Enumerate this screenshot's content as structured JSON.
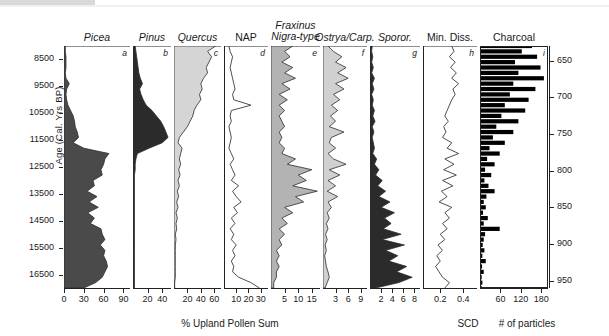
{
  "axes": {
    "left": {
      "label": "Age (Cal. Yrs BP)",
      "ticks": [
        "8500",
        "9500",
        "10500",
        "11500",
        "12500",
        "13500",
        "14500",
        "15500",
        "16500"
      ],
      "range": [
        8000,
        17000
      ]
    },
    "right": {
      "label": "Depth (cm)",
      "ticks": [
        "650",
        "700",
        "750",
        "800",
        "850",
        "900",
        "950"
      ],
      "range": [
        630,
        960
      ]
    },
    "x_units": {
      "pollen": "% Upland Pollen Sum",
      "min_diss": "SCD",
      "charcoal": "# of particles"
    }
  },
  "chart_data": {
    "type": "area",
    "title": "",
    "xlabel": "% Upland Pollen Sum",
    "ylabel": "Age (Cal. Yrs BP)",
    "grid": false,
    "legend_position": "none",
    "y_axis_secondary": {
      "label": "Depth (cm)",
      "ticks": [
        650,
        700,
        750,
        800,
        850,
        900,
        950
      ]
    },
    "y": [
      8000,
      8200,
      8400,
      8600,
      8800,
      9000,
      9200,
      9400,
      9600,
      9800,
      10000,
      10200,
      10400,
      10600,
      10800,
      11000,
      11200,
      11400,
      11600,
      11800,
      12000,
      12200,
      12400,
      12600,
      12800,
      13000,
      13200,
      13400,
      13600,
      13800,
      14000,
      14200,
      14400,
      14600,
      14800,
      15000,
      15200,
      15400,
      15600,
      15800,
      16000,
      16200,
      16400,
      16600,
      16800,
      17000
    ],
    "panels": [
      {
        "key": "picea",
        "letter": "a",
        "title": "Picea",
        "italic": true,
        "fill": "#4a4a4a",
        "style": "filled",
        "xlim": [
          0,
          100
        ],
        "xticks": [
          0,
          30,
          60,
          90
        ],
        "values": [
          2,
          2,
          3,
          3,
          3,
          2,
          3,
          8,
          4,
          3,
          4,
          6,
          10,
          14,
          16,
          17,
          20,
          22,
          14,
          30,
          68,
          62,
          60,
          56,
          58,
          44,
          46,
          35,
          50,
          38,
          52,
          36,
          46,
          40,
          56,
          58,
          62,
          55,
          62,
          60,
          64,
          66,
          62,
          58,
          48,
          30
        ]
      },
      {
        "key": "pinus",
        "letter": "b",
        "title": "Pinus",
        "italic": true,
        "fill": "#2b2b2b",
        "style": "filled",
        "xlim": [
          0,
          52
        ],
        "xticks": [
          20,
          40
        ],
        "values": [
          3,
          4,
          5,
          6,
          7,
          8,
          10,
          13,
          9,
          11,
          14,
          18,
          26,
          32,
          38,
          42,
          45,
          48,
          40,
          22,
          6,
          4,
          3,
          3,
          2,
          2,
          2,
          2,
          2,
          2,
          2,
          2,
          2,
          2,
          2,
          2,
          2,
          2,
          2,
          2,
          2,
          2,
          2,
          2,
          2,
          2
        ]
      },
      {
        "key": "quercus",
        "letter": "c",
        "title": "Quercus",
        "italic": true,
        "fill": "#d5d5d5",
        "style": "filled",
        "xlim": [
          0,
          70
        ],
        "xticks": [
          20,
          40,
          60
        ],
        "values": [
          62,
          50,
          56,
          52,
          48,
          50,
          44,
          40,
          42,
          38,
          40,
          34,
          30,
          28,
          24,
          20,
          14,
          8,
          6,
          12,
          10,
          8,
          10,
          7,
          9,
          6,
          8,
          5,
          7,
          4,
          6,
          3,
          5,
          3,
          4,
          2,
          3,
          2,
          2,
          2,
          2,
          2,
          2,
          2,
          1,
          1
        ]
      },
      {
        "key": "nap",
        "letter": "d",
        "title": "NAP",
        "italic": false,
        "fill": "none",
        "style": "line",
        "xlim": [
          0,
          36
        ],
        "xticks": [
          10,
          20,
          30
        ],
        "values": [
          4,
          5,
          7,
          6,
          5,
          6,
          7,
          8,
          9,
          7,
          8,
          22,
          6,
          5,
          6,
          4,
          5,
          6,
          5,
          4,
          6,
          8,
          5,
          7,
          9,
          6,
          12,
          7,
          10,
          14,
          8,
          11,
          6,
          9,
          5,
          8,
          6,
          10,
          7,
          9,
          6,
          8,
          7,
          12,
          22,
          29
        ]
      },
      {
        "key": "fraxinus",
        "letter": "e",
        "title": "Fraxinus Nigra-type",
        "italic": true,
        "fill": "#b3b3b3",
        "style": "filled",
        "xlim": [
          0,
          18
        ],
        "xticks": [
          5,
          10,
          15
        ],
        "values": [
          8,
          5,
          7,
          4,
          8,
          5,
          9,
          4,
          7,
          3,
          6,
          3,
          5,
          3,
          4,
          5,
          3,
          4,
          3,
          5,
          4,
          9,
          6,
          15,
          10,
          13,
          8,
          17,
          9,
          12,
          5,
          8,
          4,
          6,
          3,
          5,
          3,
          4,
          2,
          3,
          2,
          3,
          2,
          2,
          1,
          1
        ]
      },
      {
        "key": "ostrya",
        "letter": "f",
        "title": "Ostrya/Carp.",
        "italic": true,
        "fill": "#d0d0d0",
        "style": "filled",
        "xlim": [
          0,
          10.5
        ],
        "xticks": [
          3,
          6,
          9
        ],
        "values": [
          1.2,
          2.5,
          4.5,
          3.0,
          5.5,
          3.5,
          6.0,
          3.0,
          5.0,
          2.5,
          4.0,
          2.0,
          3.5,
          1.8,
          3.0,
          1.5,
          5.0,
          2.0,
          1.5,
          3.0,
          1.2,
          2.5,
          5.5,
          1.5,
          4.0,
          1.2,
          3.0,
          1.0,
          3.5,
          1.2,
          2.0,
          1.0,
          1.5,
          0.8,
          1.2,
          0.6,
          1.0,
          0.5,
          0.8,
          0.4,
          0.6,
          0.8,
          1.2,
          1.5,
          1.0,
          0.5
        ]
      },
      {
        "key": "sporor",
        "letter": "g",
        "title": "Sporor.",
        "italic": true,
        "fill": "#2b2b2b",
        "style": "filled",
        "xlim": [
          0,
          9
        ],
        "xticks": [
          2,
          4,
          6,
          8
        ],
        "values": [
          0.4,
          0.3,
          0.5,
          0.3,
          0.6,
          0.3,
          0.8,
          0.4,
          0.7,
          0.3,
          0.6,
          0.4,
          0.8,
          0.5,
          0.9,
          0.4,
          0.7,
          0.4,
          0.6,
          0.8,
          0.5,
          1.2,
          0.8,
          1.6,
          1.0,
          2.2,
          1.4,
          2.8,
          1.6,
          3.6,
          2.0,
          4.4,
          2.6,
          3.8,
          2.4,
          5.6,
          2.2,
          6.2,
          2.8,
          5.0,
          3.4,
          6.6,
          4.8,
          7.6,
          5.2,
          1.0
        ]
      },
      {
        "key": "min_diss",
        "letter": "h",
        "title": "Min. Diss.",
        "italic": false,
        "fill": "none",
        "style": "line",
        "xlim": [
          0.05,
          0.52
        ],
        "xticks": [
          0.2,
          0.4
        ],
        "values": [
          0.3,
          0.32,
          0.28,
          0.33,
          0.29,
          0.34,
          0.3,
          0.36,
          0.31,
          0.33,
          0.3,
          0.28,
          0.26,
          0.24,
          0.27,
          0.23,
          0.25,
          0.22,
          0.3,
          0.26,
          0.36,
          0.24,
          0.32,
          0.23,
          0.34,
          0.22,
          0.31,
          0.21,
          0.26,
          0.19,
          0.3,
          0.24,
          0.28,
          0.22,
          0.26,
          0.2,
          0.24,
          0.18,
          0.22,
          0.17,
          0.2,
          0.16,
          0.19,
          0.22,
          0.28,
          0.24
        ]
      },
      {
        "key": "charcoal",
        "letter": "i",
        "title": "Charcoal",
        "italic": false,
        "fill": "#000000",
        "style": "bars",
        "xlim": [
          0,
          200
        ],
        "xticks": [
          60,
          120,
          180
        ],
        "values": [
          150,
          120,
          165,
          100,
          175,
          110,
          185,
          95,
          160,
          85,
          140,
          70,
          130,
          60,
          110,
          45,
          95,
          35,
          70,
          25,
          55,
          18,
          40,
          12,
          30,
          10,
          22,
          40,
          16,
          8,
          14,
          6,
          20,
          8,
          55,
          12,
          8,
          5,
          10,
          4,
          14,
          3,
          8,
          2,
          4,
          2
        ]
      }
    ]
  }
}
